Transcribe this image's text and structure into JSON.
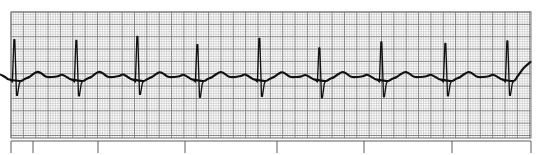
{
  "image": {
    "kind": "ecg-rhythm-strip",
    "width": 541,
    "height": 155,
    "background_color": "#ffffff",
    "title": "",
    "caption": ""
  },
  "grid": {
    "x": 11,
    "y": 12,
    "width": 520,
    "height": 126,
    "small_cell_px": 2.47,
    "bold_every": 5,
    "small_line_color": "#b9b9b9",
    "bold_line_color": "#7a7a7a",
    "border_color": "#6e6e6e",
    "paper_color": "#ffffff",
    "small_line_width": 0.5,
    "bold_line_width": 0.9,
    "label_small": "1 mm",
    "label_bold": "5 mm"
  },
  "trace": {
    "color": "#111111",
    "line_width": 2.1,
    "spike_width": 1.0,
    "baseline_y": 78,
    "r_peak_y": 31,
    "s_trough_y": 104,
    "t_peak_y": 66,
    "p_peak_y": 69,
    "lead_label": "",
    "beat_count": 10,
    "beat_spacing_px": 61.2,
    "first_r_x": 15
  },
  "chart_data": {
    "type": "line",
    "xlabel": "Time",
    "ylabel": "Amplitude",
    "rhythm": "normal sinus rhythm",
    "paper_speed_mm_per_s": 25,
    "gain_mm_per_mV": 10,
    "grid_small_mm": 1,
    "grid_large_mm": 5,
    "ylim": [
      -1.2,
      2.2
    ],
    "xlim": [
      0,
      5.2
    ],
    "legend": [],
    "annotations": [],
    "r_peak_x_px": [
      15,
      77,
      138,
      198,
      260,
      320,
      382,
      446,
      508
    ],
    "bottom_tick_x_px": [
      33,
      98,
      185,
      277,
      364,
      452,
      531
    ],
    "bottom_rule_y_px": 141,
    "beats": [
      {
        "index": 1,
        "r_x_px": 15,
        "r_amp_mv": 1.55,
        "s_amp_mv": -0.7,
        "t_amp_mv": 0.24,
        "p_amp_mv": 0.14
      },
      {
        "index": 2,
        "r_x_px": 77,
        "r_amp_mv": 1.52,
        "s_amp_mv": -0.72,
        "t_amp_mv": 0.25,
        "p_amp_mv": 0.13
      },
      {
        "index": 3,
        "r_x_px": 138,
        "r_amp_mv": 1.68,
        "s_amp_mv": -0.66,
        "t_amp_mv": 0.25,
        "p_amp_mv": 0.14
      },
      {
        "index": 4,
        "r_x_px": 198,
        "r_amp_mv": 1.35,
        "s_amp_mv": -0.78,
        "t_amp_mv": 0.23,
        "p_amp_mv": 0.13
      },
      {
        "index": 5,
        "r_x_px": 260,
        "r_amp_mv": 1.6,
        "s_amp_mv": -0.74,
        "t_amp_mv": 0.24,
        "p_amp_mv": 0.14
      },
      {
        "index": 6,
        "r_x_px": 320,
        "r_amp_mv": 1.22,
        "s_amp_mv": -0.8,
        "t_amp_mv": 0.23,
        "p_amp_mv": 0.12
      },
      {
        "index": 7,
        "r_x_px": 382,
        "r_amp_mv": 1.46,
        "s_amp_mv": -0.76,
        "t_amp_mv": 0.24,
        "p_amp_mv": 0.13
      },
      {
        "index": 8,
        "r_x_px": 446,
        "r_amp_mv": 1.4,
        "s_amp_mv": -0.72,
        "t_amp_mv": 0.24,
        "p_amp_mv": 0.13
      },
      {
        "index": 9,
        "r_x_px": 508,
        "r_amp_mv": 1.5,
        "s_amp_mv": -0.7,
        "t_amp_mv": 0.24,
        "p_amp_mv": 0.13
      }
    ]
  }
}
